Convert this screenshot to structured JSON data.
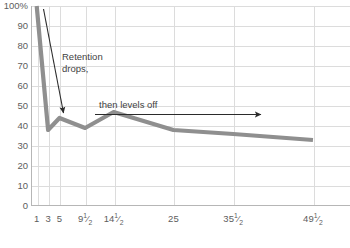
{
  "chart_data": {
    "type": "line",
    "title": "",
    "xlabel": "",
    "ylabel": "",
    "ylim": [
      0,
      100
    ],
    "xlim": [
      0,
      56
    ],
    "grid": true,
    "legend": false,
    "y_ticks": [
      "0",
      "10",
      "20",
      "30",
      "40",
      "50",
      "60",
      "70",
      "80",
      "90",
      "100%"
    ],
    "y_tick_values": [
      0,
      10,
      20,
      30,
      40,
      50,
      60,
      70,
      80,
      90,
      100
    ],
    "x_tick_labels": [
      "1",
      "3",
      "5",
      "9½",
      "14½",
      "25",
      "35½",
      "49½"
    ],
    "x_tick_values": [
      1,
      3,
      5,
      9.5,
      14.5,
      25,
      35.5,
      49.5
    ],
    "series": [
      {
        "name": "Retention",
        "color": "#8f8f8f",
        "x": [
          1,
          3,
          5,
          9.5,
          14.5,
          25,
          35.5,
          49.5
        ],
        "values": [
          100,
          38,
          44,
          39,
          47,
          38,
          36,
          33
        ]
      }
    ],
    "annotations": [
      {
        "id": "retention-drops",
        "text_lines": [
          "Retention",
          "drops,"
        ],
        "kind": "arrow-label",
        "arrow": "diagonal-down-right"
      },
      {
        "id": "then-levels-off",
        "text_lines": [
          "then levels off"
        ],
        "kind": "arrow-label",
        "arrow": "horizontal-right"
      }
    ]
  },
  "annotations": {
    "retention_line1": "Retention",
    "retention_line2": "drops,",
    "levels_off": "then levels off"
  },
  "axis": {
    "y_labels": [
      "100%",
      "90",
      "80",
      "70",
      "60",
      "50",
      "40",
      "30",
      "20",
      "10",
      "0"
    ],
    "x_labels": [
      {
        "whole": "1",
        "num": "",
        "den": ""
      },
      {
        "whole": "3",
        "num": "",
        "den": ""
      },
      {
        "whole": "5",
        "num": "",
        "den": ""
      },
      {
        "whole": "9",
        "num": "1",
        "den": "2"
      },
      {
        "whole": "14",
        "num": "1",
        "den": "2"
      },
      {
        "whole": "25",
        "num": "",
        "den": ""
      },
      {
        "whole": "35",
        "num": "1",
        "den": "2"
      },
      {
        "whole": "49",
        "num": "1",
        "den": "2"
      }
    ]
  },
  "colors": {
    "line": "#8f8f8f",
    "grid": "#dcdcdc",
    "axis": "#b6b6b6",
    "text": "#5d5d5d",
    "annotation_text": "#3f3f3f",
    "arrow": "#2b2b2b"
  }
}
